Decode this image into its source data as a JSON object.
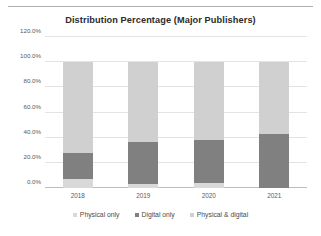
{
  "chart_data": {
    "type": "bar",
    "stacked": true,
    "stacked_mode": "percent",
    "title": "Distribution Percentage (Major Publishers)",
    "xlabel": "",
    "ylabel": "",
    "categories": [
      "2018",
      "2019",
      "2020",
      "2021"
    ],
    "series": [
      {
        "name": "Physical only",
        "values": [
          7.5,
          3.0,
          4.0,
          0.0
        ],
        "color": "#d9d9d9"
      },
      {
        "name": "Digital only",
        "values": [
          20.5,
          33.5,
          34.5,
          43.0
        ],
        "color": "#808080"
      },
      {
        "name": "Physical & digital",
        "values": [
          72.0,
          63.5,
          61.5,
          57.0
        ],
        "color": "#d0d0d0"
      }
    ],
    "ylim": [
      0,
      120
    ],
    "ytick_labels": [
      "120.0%",
      "100.0%",
      "80.0%",
      "60.0%",
      "40.0%",
      "20.0%",
      "0.0%"
    ],
    "ytick_values": [
      120,
      100,
      80,
      60,
      40,
      20,
      0
    ],
    "grid": true,
    "legend_position": "bottom"
  },
  "legend": {
    "items": [
      {
        "label": "Physical only"
      },
      {
        "label": "Digital only"
      },
      {
        "label": "Physical & digital"
      }
    ]
  }
}
